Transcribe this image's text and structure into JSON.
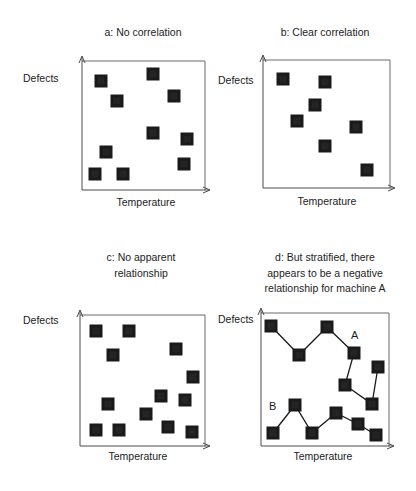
{
  "chart_data": [
    {
      "type": "scatter",
      "panel": "a",
      "title": "a: No correlation",
      "xlabel": "Temperature",
      "ylabel": "Defects",
      "grid": false,
      "frame": {
        "left": 82,
        "top": 61,
        "right": 205,
        "bottom": 190
      },
      "points": [
        [
          101,
          81
        ],
        [
          153,
          74
        ],
        [
          117,
          101
        ],
        [
          174,
          96
        ],
        [
          153,
          133
        ],
        [
          187,
          139
        ],
        [
          106,
          152
        ],
        [
          184,
          164
        ],
        [
          95,
          174
        ],
        [
          123,
          174
        ]
      ]
    },
    {
      "type": "scatter",
      "panel": "b",
      "title": "b: Clear correlation",
      "xlabel": "Temperature",
      "ylabel": "Defects",
      "grid": false,
      "frame": {
        "left": 263,
        "top": 60,
        "right": 390,
        "bottom": 188
      },
      "points": [
        [
          283,
          79
        ],
        [
          325,
          82
        ],
        [
          315,
          105
        ],
        [
          297,
          121
        ],
        [
          356,
          127
        ],
        [
          325,
          146
        ],
        [
          367,
          170
        ]
      ]
    },
    {
      "type": "scatter",
      "panel": "c",
      "title": "c: No apparent relationship",
      "title_lines": [
        "c: No apparent",
        "relationship"
      ],
      "xlabel": "Temperature",
      "ylabel": "Defects",
      "grid": false,
      "frame": {
        "left": 80,
        "top": 315,
        "right": 205,
        "bottom": 446
      },
      "points": [
        [
          96,
          331
        ],
        [
          129,
          331
        ],
        [
          113,
          355
        ],
        [
          176,
          349
        ],
        [
          193,
          377
        ],
        [
          108,
          404
        ],
        [
          161,
          396
        ],
        [
          185,
          400
        ],
        [
          146,
          414
        ],
        [
          96,
          430
        ],
        [
          119,
          430
        ],
        [
          168,
          427
        ],
        [
          192,
          432
        ]
      ]
    },
    {
      "type": "line",
      "panel": "d",
      "title": "d: But stratified, there appears to be a negative relationship for machine A",
      "title_lines": [
        "d: But stratified, there",
        "appears to be a negative",
        "relationship for machine A"
      ],
      "xlabel": "Temperature",
      "ylabel": "Defects",
      "grid": false,
      "frame": {
        "left": 261,
        "top": 313,
        "right": 389,
        "bottom": 446
      },
      "series": [
        {
          "name": "A",
          "label_pos": [
            351,
            335
          ],
          "points": [
            [
              271,
              326
            ],
            [
              299,
              355
            ],
            [
              327,
              327
            ],
            [
              354,
              353
            ],
            [
              345,
              385
            ],
            [
              372,
              404
            ],
            [
              378,
              367
            ]
          ]
        },
        {
          "name": "B",
          "label_pos": [
            269,
            406
          ],
          "points": [
            [
              273,
              433
            ],
            [
              295,
              405
            ],
            [
              312,
              433
            ],
            [
              336,
              413
            ],
            [
              358,
              424
            ],
            [
              376,
              435
            ]
          ]
        }
      ]
    }
  ],
  "panels": {
    "a": {
      "title": "a: No correlation",
      "ylabel": "Defects",
      "xlabel": "Temperature"
    },
    "b": {
      "title": "b: Clear correlation",
      "ylabel": "Defects",
      "xlabel": "Temperature"
    },
    "c": {
      "title_line1": "c: No apparent",
      "title_line2": "relationship",
      "ylabel": "Defects",
      "xlabel": "Temperature"
    },
    "d": {
      "title_line1": "d: But stratified, there",
      "title_line2": "appears to be a negative",
      "title_line3": "relationship for machine A",
      "ylabel": "Defects",
      "xlabel": "Temperature",
      "series_a_label": "A",
      "series_b_label": "B"
    }
  },
  "style": {
    "marker_color": "#1a1a1a",
    "frame_color": "#6a6a6a",
    "line_color": "#1a1a1a",
    "marker_size": 13
  }
}
